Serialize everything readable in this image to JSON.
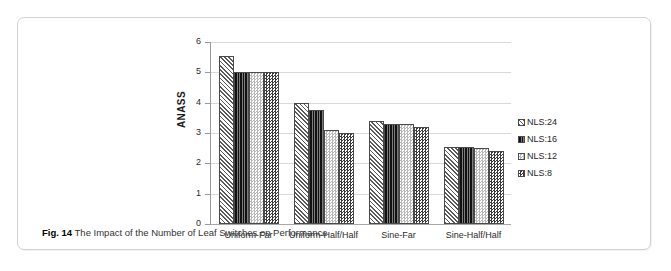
{
  "figure": {
    "caption_prefix": "Fig. 14",
    "caption_text": "The Impact of the Number of Leaf Switches on Performance"
  },
  "chart_data": {
    "type": "bar",
    "title": "",
    "subtitle": "",
    "xlabel": "",
    "ylabel": "ANASS",
    "ylim": [
      0,
      6
    ],
    "ytick_labels": [
      "6",
      "5",
      "4",
      "3",
      "2",
      "1",
      "0"
    ],
    "ytick_values": [
      6,
      5,
      4,
      3,
      2,
      1,
      0
    ],
    "grid": "horizontal",
    "legend_position": "right",
    "categories": [
      "Uniform-Far",
      "Uniform-Half/Half",
      "Sine-Far",
      "Sine-Half/Half"
    ],
    "series": [
      {
        "name": "NLS:24",
        "pattern": "diagonal-hatch",
        "values": [
          5.55,
          4.0,
          3.4,
          2.55
        ]
      },
      {
        "name": "NLS:16",
        "pattern": "dark-vertical-lines",
        "values": [
          5.0,
          3.75,
          3.3,
          2.55
        ]
      },
      {
        "name": "NLS:12",
        "pattern": "light-checker",
        "values": [
          5.0,
          3.1,
          3.3,
          2.5
        ]
      },
      {
        "name": "NLS:8",
        "pattern": "dark-checker",
        "values": [
          5.0,
          3.0,
          3.2,
          2.4
        ]
      }
    ]
  },
  "colors": {
    "border": "#d2d2d2",
    "gridline": "#d9d9d9",
    "axis": "#9a9a9a",
    "bar_outline": "#4a4a4a",
    "text": "#2b2b2b"
  }
}
